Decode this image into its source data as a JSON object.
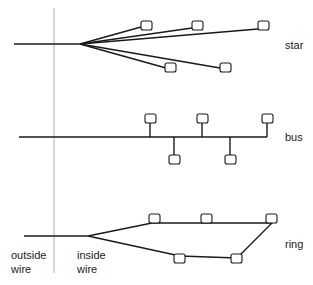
{
  "colors": {
    "line": "#1a1a1a",
    "divider": "#9a9a9a",
    "node_fill": "#ffffff"
  },
  "labels": {
    "star": "star",
    "bus": "bus",
    "ring": "ring",
    "outside_1": "outside",
    "outside_2": "wire",
    "inside_1": "inside",
    "inside_2": "wire"
  },
  "topologies": [
    {
      "name": "star",
      "feed": {
        "x1": 14,
        "y1": 44,
        "x2": 80,
        "y2": 44
      },
      "hub": {
        "x": 80,
        "y": 44
      },
      "nodes": [
        {
          "x": 146,
          "y": 26
        },
        {
          "x": 197,
          "y": 26
        },
        {
          "x": 263,
          "y": 26
        },
        {
          "x": 170,
          "y": 68
        },
        {
          "x": 225,
          "y": 68
        }
      ]
    },
    {
      "name": "bus",
      "bus_line": {
        "x1": 19,
        "y1": 137,
        "x2": 267,
        "y2": 137
      },
      "nodes_above": [
        {
          "x": 150,
          "y": 118
        },
        {
          "x": 202,
          "y": 118
        },
        {
          "x": 267,
          "y": 118
        }
      ],
      "nodes_below": [
        {
          "x": 175,
          "y": 160
        },
        {
          "x": 231,
          "y": 160
        }
      ]
    },
    {
      "name": "ring",
      "feed": {
        "x1": 24,
        "y1": 236,
        "x2": 88,
        "y2": 236
      },
      "top_nodes": [
        {
          "x": 155,
          "y": 218
        },
        {
          "x": 207,
          "y": 218
        },
        {
          "x": 272,
          "y": 218
        }
      ],
      "bottom_nodes": [
        {
          "x": 180,
          "y": 258
        },
        {
          "x": 236,
          "y": 258
        }
      ]
    }
  ]
}
